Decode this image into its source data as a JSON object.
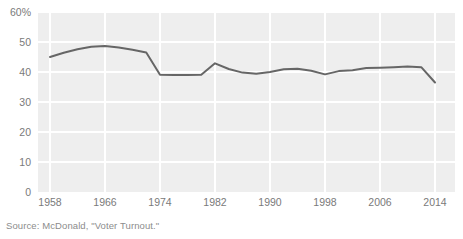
{
  "figure": {
    "source_note": "Source: McDonald, \"Voter Turnout.\""
  },
  "chart_data": {
    "type": "line",
    "title": "",
    "subtitle": "",
    "xlabel": "",
    "ylabel": "",
    "grid": true,
    "legend_position": "none",
    "xlim": [
      1958,
      2014
    ],
    "ylim": [
      0,
      60
    ],
    "y_tick_labels": [
      "60%",
      "50",
      "40",
      "30",
      "20",
      "10",
      "0"
    ],
    "y_ticks": [
      60,
      50,
      40,
      30,
      20,
      10,
      0
    ],
    "x_tick_labels": [
      "1958",
      "1966",
      "1974",
      "1982",
      "1990",
      "1998",
      "2006",
      "2014"
    ],
    "x_ticks": [
      1958,
      1966,
      1974,
      1982,
      1990,
      1998,
      2006,
      2014
    ],
    "series": [
      {
        "name": "Voter turnout",
        "color": "#666666",
        "x": [
          1958,
          1960,
          1962,
          1964,
          1966,
          1968,
          1970,
          1972,
          1974,
          1976,
          1978,
          1980,
          1982,
          1984,
          1986,
          1988,
          1990,
          1992,
          1994,
          1996,
          1998,
          2000,
          2002,
          2004,
          2006,
          2008,
          2010,
          2012,
          2014
        ],
        "values": [
          45.0,
          46.4,
          47.6,
          48.4,
          48.7,
          48.2,
          47.4,
          46.5,
          39.1,
          39.0,
          39.0,
          39.1,
          42.9,
          41.0,
          39.8,
          39.4,
          40.0,
          40.9,
          41.1,
          40.4,
          39.2,
          40.3,
          40.6,
          41.3,
          41.4,
          41.6,
          41.8,
          41.6,
          36.5
        ]
      }
    ]
  }
}
